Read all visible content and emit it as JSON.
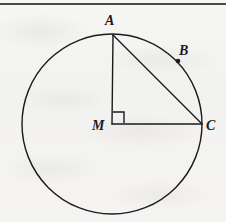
{
  "figure": {
    "kind": "circle-geometry-diagram",
    "caption": "",
    "background_color": "#f4f4f2",
    "stroke_color": "#1b1b1b",
    "top_rule": {
      "name": "horizontal-rule",
      "y": 3,
      "x_start": 0,
      "x_end": 226,
      "color": "#4a4a4a",
      "thickness": 2
    },
    "circle": {
      "name": "circle",
      "center_x": 112,
      "center_y": 124,
      "radius": 90,
      "stroke_width": 1.4
    },
    "points": [
      {
        "id": "A",
        "label": "A",
        "x": 113,
        "y": 35,
        "on_circle": true,
        "dot": false
      },
      {
        "id": "B",
        "label": "B",
        "x": 178,
        "y": 61,
        "on_circle": true,
        "dot": true
      },
      {
        "id": "C",
        "label": "C",
        "x": 202,
        "y": 124,
        "on_circle": true,
        "dot": false
      },
      {
        "id": "M",
        "label": "M",
        "x": 112,
        "y": 124,
        "on_circle": false,
        "dot": false
      }
    ],
    "segments": [
      {
        "id": "MA",
        "from": "M",
        "to": "A",
        "x1": 112,
        "y1": 124,
        "x2": 113,
        "y2": 35,
        "stroke_width": 1.4
      },
      {
        "id": "MC",
        "from": "M",
        "to": "C",
        "x1": 112,
        "y1": 124,
        "x2": 202,
        "y2": 124,
        "stroke_width": 1.4
      },
      {
        "id": "AC",
        "from": "A",
        "to": "C",
        "x1": 113,
        "y1": 35,
        "x2": 202,
        "y2": 124,
        "stroke_width": 1.4
      }
    ],
    "right_angle_marker": {
      "id": "angle-AMC",
      "at_point": "M",
      "size": 11,
      "x": 113,
      "y": 112,
      "stroke_width": 1.4
    },
    "labels": {
      "A": "A",
      "B": "B",
      "C": "C",
      "M": "M"
    }
  }
}
